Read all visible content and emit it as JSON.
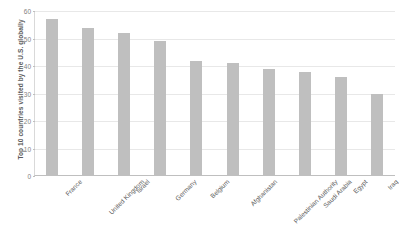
{
  "chart_data": {
    "type": "bar",
    "title": "",
    "xlabel": "",
    "ylabel": "Top 10 countries visited by the U.S. globally",
    "categories": [
      "France",
      "United Kingdom",
      "Israel",
      "Germany",
      "Belgium",
      "Afghanistan",
      "Palestinian Authority",
      "Saudi Arabia",
      "Egypt",
      "Iraq"
    ],
    "values": [
      57,
      54,
      52,
      49,
      42,
      41,
      39,
      38,
      36,
      30
    ],
    "ylim": [
      0,
      60
    ],
    "yticks": [
      0,
      10,
      20,
      30,
      40,
      50,
      60
    ],
    "ytick_labels": [
      "0",
      "10",
      "20",
      "30",
      "40",
      "50",
      "60"
    ],
    "grid": true,
    "legend": false,
    "bar_color": "#bfbfbf",
    "gridline_color": "#e8e8e8",
    "axis_color": "#bfbfbf",
    "text_color": "#595959",
    "tick_label_color": "#7f7f7f",
    "background_color": "#ffffff"
  }
}
